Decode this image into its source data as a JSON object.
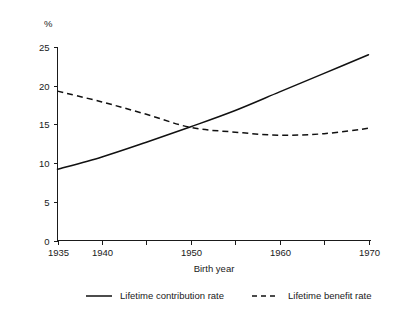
{
  "chart_data": {
    "type": "line",
    "title": "",
    "xlabel": "Birth year",
    "ylabel": "",
    "unit_label": "%",
    "xlim": [
      1935,
      1970
    ],
    "ylim": [
      0,
      25
    ],
    "grid": false,
    "legend_position": "bottom",
    "x_tick_values": [
      1935,
      1940,
      1945,
      1950,
      1955,
      1960,
      1965,
      1970
    ],
    "x_tick_labels": [
      "1935",
      "1940",
      "",
      "1950",
      "",
      "1960",
      "",
      "1970"
    ],
    "y_tick_values": [
      0,
      5,
      10,
      15,
      20,
      25
    ],
    "y_tick_labels": [
      "0",
      "5",
      "10",
      "15",
      "20",
      "25"
    ],
    "x": [
      1935,
      1940,
      1945,
      1950,
      1955,
      1960,
      1965,
      1970
    ],
    "series": [
      {
        "name": "Lifetime contribution rate",
        "style": "solid",
        "color": "#111111",
        "values": [
          9.2,
          10.8,
          12.7,
          14.7,
          16.8,
          19.2,
          21.6,
          24.0
        ]
      },
      {
        "name": "Lifetime benefit rate",
        "style": "dashed",
        "color": "#111111",
        "values": [
          19.3,
          17.9,
          16.3,
          14.6,
          14.0,
          13.6,
          13.8,
          14.5
        ]
      }
    ]
  },
  "axes": {
    "x_title": "Birth year",
    "y_unit": "%"
  },
  "legend": {
    "items": [
      {
        "label": "Lifetime contribution rate",
        "style": "solid"
      },
      {
        "label": "Lifetime benefit rate",
        "style": "dashed"
      }
    ]
  }
}
